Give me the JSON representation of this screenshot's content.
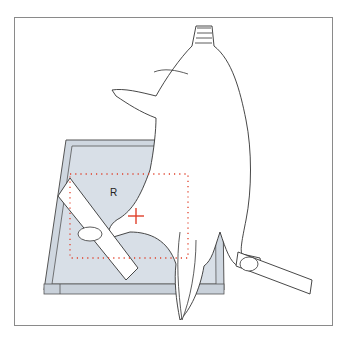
{
  "figure": {
    "type": "radiographic-positioning-illustration",
    "side_marker": "R",
    "colors": {
      "cassette_fill": "#d5dce4",
      "cassette_edge": "#555555",
      "collimation": "#e0402a",
      "centering_cross": "#e0402a",
      "outline": "#333333",
      "frame_border": "#8a8a8a"
    },
    "elements": [
      "cassette",
      "collimation-field",
      "centering-cross",
      "side-marker",
      "animal",
      "positioning-strap-left",
      "positioning-strap-right"
    ]
  }
}
